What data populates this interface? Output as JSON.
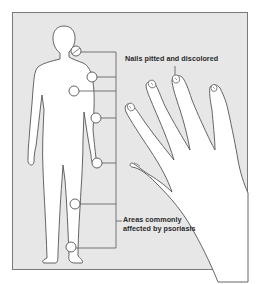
{
  "diagram": {
    "type": "medical-illustration",
    "colors": {
      "frame_border": "#7a7a7a",
      "background": "#e7e7e7",
      "figure_fill": "#ffffff",
      "outline": "#555555",
      "connector": "#666666",
      "text": "#2a2a2a"
    },
    "labels": {
      "nails": "Nails pitted and discolored",
      "areas_line1": "Areas commonly",
      "areas_line2": "affected by psoriasis"
    },
    "body_markers": [
      {
        "id": "scalp-neck",
        "label": "neck / hairline"
      },
      {
        "id": "shoulder",
        "label": "shoulder"
      },
      {
        "id": "chest",
        "label": "chest / trunk"
      },
      {
        "id": "elbow",
        "label": "elbow"
      },
      {
        "id": "wrist-hand",
        "label": "wrist / hand"
      },
      {
        "id": "knee",
        "label": "knee"
      },
      {
        "id": "ankle-foot",
        "label": "ankle / foot"
      }
    ],
    "hand": {
      "affected_nails": 4,
      "description": "left hand with pitted nails"
    }
  }
}
